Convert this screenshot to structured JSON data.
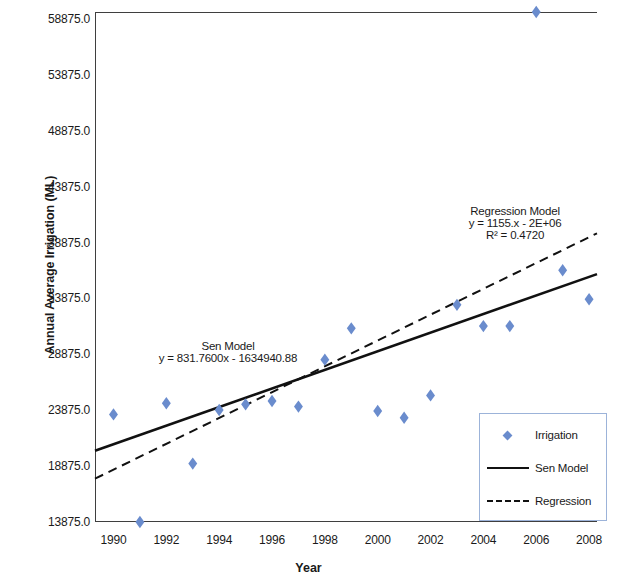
{
  "chart_data": {
    "type": "scatter",
    "title": "",
    "xlabel": "Year",
    "ylabel": "Annual Average Irrigation (ML)",
    "xlim": [
      1989.3,
      2008.3
    ],
    "ylim": [
      13875.0,
      59500.0
    ],
    "grid": false,
    "legend_position": "bottom-right",
    "x_ticks": [
      "1990",
      "1992",
      "1994",
      "1996",
      "1998",
      "2000",
      "2002",
      "2004",
      "2006",
      "2008"
    ],
    "y_ticks": [
      "13875.0",
      "18875.0",
      "23875.0",
      "28875.0",
      "33875.0",
      "38875.0",
      "43875.0",
      "48875.0",
      "53875.0",
      "58875.0"
    ],
    "series": [
      {
        "name": "Irrigation",
        "type": "scatter",
        "marker": "diamond",
        "color": "#6a8ccd",
        "x": [
          1990,
          1991,
          1992,
          1993,
          1994,
          1995,
          1996,
          1997,
          1998,
          1999,
          2000,
          2001,
          2002,
          2003,
          2004,
          2005,
          2006,
          2007,
          2008
        ],
        "values": [
          23500,
          13875,
          24500,
          19100,
          23900,
          24400,
          24700,
          24200,
          28400,
          31200,
          23800,
          23200,
          25200,
          33300,
          31400,
          31400,
          59500,
          36400,
          33800
        ]
      },
      {
        "name": "Sen Model",
        "type": "line",
        "style": "solid",
        "color": "#111111",
        "slope": 831.76,
        "intercept": -1634940.88,
        "x": [
          1989.3,
          2008.3
        ],
        "values": [
          20250,
          36050
        ]
      },
      {
        "name": "Regression",
        "type": "line",
        "style": "dashed",
        "color": "#111111",
        "slope": 1155,
        "intercept": -2000000,
        "r_squared": 0.472,
        "x": [
          1989.3,
          2008.3
        ],
        "values": [
          17750,
          39700
        ]
      }
    ],
    "annotations": [
      {
        "name": "sen-model-annotation",
        "line1": "Sen Model",
        "line2": "y = 831.7600x - 1634940.88"
      },
      {
        "name": "regression-model-annotation",
        "line1": "Regression Model",
        "line2": "y = 1155.x - 2E+06",
        "line3": "R² = 0.4720"
      }
    ],
    "legend": [
      {
        "label": "Irrigation",
        "key": "diamond-marker"
      },
      {
        "label": "Sen Model",
        "key": "solid-line"
      },
      {
        "label": "Regression",
        "key": "dashed-line"
      }
    ]
  }
}
